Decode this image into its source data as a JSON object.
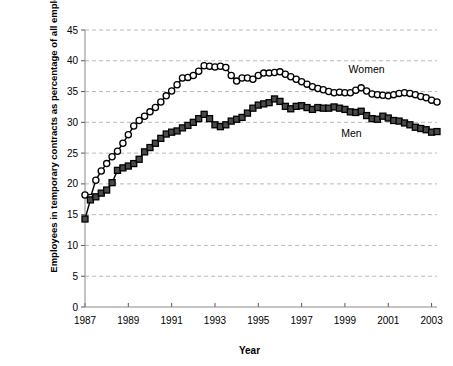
{
  "chart_data": {
    "type": "line",
    "title": "",
    "xlabel": "Year",
    "ylabel": "Employees in temporary contracts as percentage of all employees",
    "xlim": [
      1987,
      2003.25
    ],
    "ylim": [
      0,
      45
    ],
    "ytick_values": [
      0,
      5,
      10,
      15,
      20,
      25,
      30,
      35,
      40,
      45
    ],
    "ytick_labels": [
      "0",
      "5",
      "10",
      "15",
      "20",
      "25",
      "30",
      "35",
      "40",
      "45"
    ],
    "xtick_values": [
      1987,
      1989,
      1991,
      1993,
      1995,
      1997,
      1999,
      2001,
      2003
    ],
    "xtick_labels": [
      "1987",
      "1989",
      "1991",
      "1993",
      "1995",
      "1997",
      "1999",
      "2001",
      "2003"
    ],
    "grid": "horizontal-dashed",
    "legend_position": "inline-annotations",
    "x": [
      1987,
      1987.25,
      1987.5,
      1987.75,
      1988,
      1988.25,
      1988.5,
      1988.75,
      1989,
      1989.25,
      1989.5,
      1989.75,
      1990,
      1990.25,
      1990.5,
      1990.75,
      1991,
      1991.25,
      1991.5,
      1991.75,
      1992,
      1992.25,
      1992.5,
      1992.75,
      1993,
      1993.25,
      1993.5,
      1993.75,
      1994,
      1994.25,
      1994.5,
      1994.75,
      1995,
      1995.25,
      1995.5,
      1995.75,
      1996,
      1996.25,
      1996.5,
      1996.75,
      1997,
      1997.25,
      1997.5,
      1997.75,
      1998,
      1998.25,
      1998.5,
      1998.75,
      1999,
      1999.25,
      1999.5,
      1999.75,
      2000,
      2000.25,
      2000.5,
      2000.75,
      2001,
      2001.25,
      2001.5,
      2001.75,
      2002,
      2002.25,
      2002.5,
      2002.75,
      2003,
      2003.25
    ],
    "series": [
      {
        "name": "Women",
        "marker": "open-circle",
        "color": "#ffffff",
        "edge_color": "#000000",
        "values": [
          18.2,
          17.8,
          20.6,
          22.1,
          23.3,
          24.4,
          25.3,
          26.6,
          28.0,
          29.4,
          30.3,
          31.0,
          31.7,
          32.4,
          33.3,
          34.3,
          35.1,
          36.1,
          37.2,
          37.3,
          37.6,
          38.3,
          39.2,
          39.1,
          39.0,
          39.1,
          38.9,
          37.6,
          36.7,
          37.2,
          37.2,
          37.0,
          37.6,
          38.0,
          38.0,
          38.1,
          38.2,
          37.8,
          37.4,
          37.0,
          36.6,
          36.2,
          35.8,
          35.5,
          35.3,
          35.0,
          34.8,
          34.9,
          34.8,
          34.8,
          35.2,
          35.6,
          35.1,
          34.6,
          34.5,
          34.4,
          34.3,
          34.5,
          34.7,
          34.8,
          34.7,
          34.5,
          34.2,
          34.0,
          33.6,
          33.3
        ]
      },
      {
        "name": "Men",
        "marker": "filled-square",
        "color": "#4a4a4a",
        "edge_color": "#000000",
        "values": [
          14.3,
          17.4,
          17.9,
          18.5,
          19.0,
          20.2,
          22.2,
          22.6,
          22.9,
          23.3,
          24.0,
          25.2,
          25.9,
          26.6,
          27.4,
          28.1,
          28.4,
          28.6,
          29.1,
          29.5,
          30.0,
          30.6,
          31.3,
          30.6,
          29.6,
          29.3,
          29.6,
          30.2,
          30.5,
          30.8,
          31.5,
          32.3,
          32.8,
          33.0,
          33.2,
          33.8,
          33.4,
          32.6,
          32.2,
          32.6,
          32.7,
          32.4,
          32.1,
          32.4,
          32.3,
          32.3,
          32.5,
          32.3,
          32.1,
          31.7,
          31.6,
          31.8,
          31.1,
          30.6,
          30.5,
          31.0,
          30.7,
          30.3,
          30.2,
          29.9,
          29.6,
          29.2,
          29.0,
          28.8,
          28.4,
          28.5
        ]
      }
    ],
    "annotations": [
      {
        "text": "Women",
        "x": 2000.0,
        "y": 38.0
      },
      {
        "text": "Men",
        "x": 1999.3,
        "y": 27.6
      }
    ]
  }
}
